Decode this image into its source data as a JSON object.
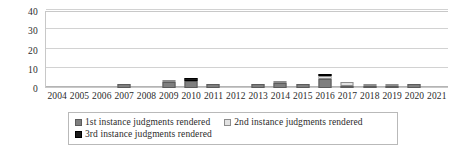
{
  "chart_data": {
    "type": "bar",
    "title": "",
    "subtitle": "",
    "xlabel": "",
    "ylabel": "",
    "ylim": [
      0,
      40
    ],
    "yticks": [
      0,
      10,
      20,
      30,
      40
    ],
    "grid": true,
    "stacked": true,
    "legend_position": "bottom",
    "categories": [
      "2004",
      "2005",
      "2006",
      "2007",
      "2008",
      "2009",
      "2010",
      "2011",
      "2012",
      "2013",
      "2014",
      "2015",
      "2016",
      "2017",
      "2018",
      "2019",
      "2020",
      "2021"
    ],
    "series": [
      {
        "name": "1st instance judgments rendered",
        "color": "#7f7f7f",
        "values": [
          0,
          0,
          0,
          2,
          0,
          3,
          3.5,
          2,
          0,
          2,
          2.5,
          2,
          4.5,
          1,
          0.5,
          0.3,
          2,
          0
        ]
      },
      {
        "name": "2nd instance judgments rendered",
        "color": "#e2e2e2",
        "values": [
          0,
          0,
          0,
          0,
          0,
          1,
          0,
          0,
          0,
          0,
          0.5,
          0,
          1.5,
          2,
          0.5,
          0.7,
          0,
          0
        ]
      },
      {
        "name": "3rd instance judgments rendered",
        "color": "#1a1a1a",
        "values": [
          0,
          0,
          0,
          0,
          0,
          0,
          1.5,
          0,
          0,
          0,
          0,
          0,
          1,
          0,
          0,
          0,
          0,
          0
        ]
      }
    ],
    "totals": [
      0,
      0,
      0,
      2,
      0,
      4,
      5,
      2,
      0,
      2,
      3,
      2,
      7,
      3,
      1,
      1,
      2,
      0
    ]
  },
  "legend": {
    "items": [
      {
        "label": "1st instance judgments rendered",
        "swatch": "series-1-swatch"
      },
      {
        "label": "2nd instance judgments rendered",
        "swatch": "series-2-swatch"
      },
      {
        "label": "3rd instance judgments rendered",
        "swatch": "series-3-swatch"
      }
    ]
  },
  "colors": {
    "series_1": "#7f7f7f",
    "series_2": "#e2e2e2",
    "series_3": "#1a1a1a",
    "gridline": "#d2d2d2",
    "axis": "#b4b4b4",
    "text": "#2b2b2b",
    "background": "#ffffff"
  }
}
